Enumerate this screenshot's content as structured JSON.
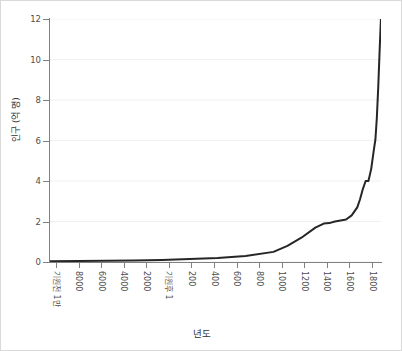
{
  "chart_data": {
    "type": "line",
    "title": "",
    "xlabel": "년도",
    "ylabel": "인구 (억 명)",
    "ylim": [
      0,
      12
    ],
    "yticks": [
      0,
      2,
      4,
      6,
      8,
      10,
      12
    ],
    "ytick_labels": [
      "0",
      "2",
      "4",
      "6",
      "8",
      "10",
      "12"
    ],
    "grid": true,
    "grid_axis": "y",
    "legend": "none",
    "line_color": "#262626",
    "line_width": 2,
    "xtick_labels": [
      "기원전 1만",
      "8000",
      "6000",
      "4000",
      "2000",
      "기원후 1",
      "200",
      "400",
      "600",
      "800",
      "1000",
      "1200",
      "1400",
      "1600",
      "1800"
    ],
    "x": [
      -10000,
      -9000,
      -8000,
      -7000,
      -6000,
      -5000,
      -4000,
      -3000,
      -2000,
      -1500,
      -1000,
      -500,
      -200,
      1,
      200,
      400,
      600,
      800,
      1000,
      1100,
      1200,
      1300,
      1340,
      1400,
      1500,
      1600,
      1650,
      1700,
      1750,
      1800,
      1850
    ],
    "values": [
      0.04,
      0.05,
      0.06,
      0.08,
      0.1,
      0.15,
      0.2,
      0.3,
      0.5,
      0.8,
      1.2,
      1.7,
      1.9,
      1.92,
      2.0,
      2.05,
      2.1,
      2.3,
      2.7,
      3.1,
      3.6,
      4.0,
      4.0,
      4.0,
      4.6,
      5.6,
      6.05,
      7.1,
      8.6,
      10.4,
      12.1
    ],
    "series": [
      {
        "name": "세계 인구",
        "values": [
          0.04,
          0.05,
          0.06,
          0.08,
          0.1,
          0.15,
          0.2,
          0.3,
          0.5,
          0.8,
          1.2,
          1.7,
          1.9,
          1.92,
          2.0,
          2.05,
          2.1,
          2.3,
          2.7,
          3.1,
          3.6,
          4.0,
          4.0,
          4.0,
          4.6,
          5.6,
          6.05,
          7.1,
          8.6,
          10.4,
          12.1
        ]
      }
    ]
  }
}
